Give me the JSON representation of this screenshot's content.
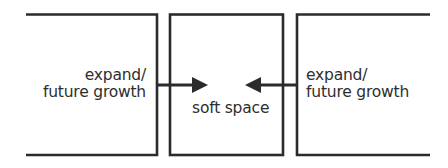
{
  "diagram": {
    "left_box": {
      "label_line1": "expand/",
      "label_line2": "future growth"
    },
    "center_box": {
      "label": "soft space"
    },
    "right_box": {
      "label_line1": "expand/",
      "label_line2": "future growth"
    },
    "arrows": [
      {
        "from": "left_box",
        "to": "center_box",
        "direction": "right"
      },
      {
        "from": "right_box",
        "to": "center_box",
        "direction": "left"
      }
    ],
    "line_color": "#2b2b2b"
  }
}
